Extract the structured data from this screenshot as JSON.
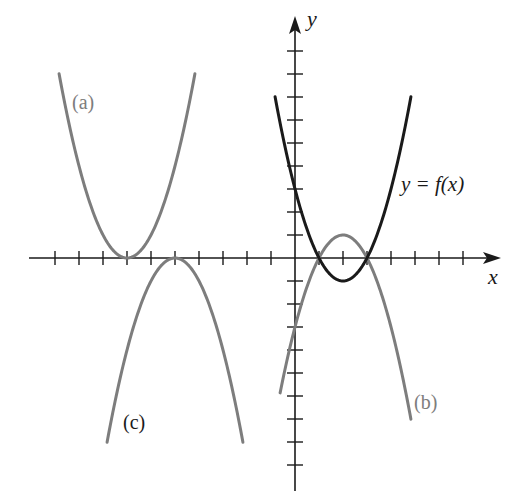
{
  "figure": {
    "axes": {
      "x_label": "x",
      "y_label": "y",
      "origin_px": [
        295,
        258
      ],
      "unit_px_x": 24,
      "unit_px_y": 23,
      "x_ticks": [
        -10,
        -9,
        -8,
        -7,
        -6,
        -5,
        -4,
        -3,
        -2,
        -1,
        1,
        2,
        3,
        4,
        5,
        6,
        7
      ],
      "y_ticks": [
        -9,
        -8,
        -7,
        -6,
        -5,
        -4,
        -3,
        -2,
        -1,
        1,
        2,
        3,
        4,
        5,
        6,
        7,
        8,
        9
      ],
      "x_range": [
        -11,
        8.5
      ],
      "y_range": [
        -10,
        10.5
      ],
      "axis_color": "#1a1a1a"
    },
    "labels": {
      "f": "y = f(x)",
      "a": "(a)",
      "b": "(b)",
      "c": "(c)"
    },
    "colors": {
      "f": "#1a1a1a",
      "transformed": "#7d7d7d"
    }
  },
  "chart_data": {
    "type": "line",
    "title": "",
    "xlabel": "x",
    "ylabel": "y",
    "grid": false,
    "xlim": [
      -11,
      8.5
    ],
    "ylim": [
      -10,
      10.5
    ],
    "series": [
      {
        "name": "y = f(x)",
        "equation": "y = (x-1)(x-3)",
        "vertex": [
          2,
          -1
        ],
        "x_range": [
          -0.83,
          4.83
        ],
        "color": "#1a1a1a"
      },
      {
        "name": "(a)",
        "equation": "y = (x+7)^2",
        "vertex": [
          -7,
          0
        ],
        "x_range": [
          -9.83,
          -4.17
        ],
        "color": "#7d7d7d"
      },
      {
        "name": "(b)",
        "equation": "y = -(x-1)(x-3)",
        "vertex": [
          2,
          1
        ],
        "x_range": [
          -0.62,
          4.83
        ],
        "color": "#7d7d7d"
      },
      {
        "name": "(c)",
        "equation": "y = -(x+5)^2",
        "vertex": [
          -5,
          0
        ],
        "x_range": [
          -7.83,
          -2.17
        ],
        "color": "#7d7d7d"
      }
    ]
  }
}
